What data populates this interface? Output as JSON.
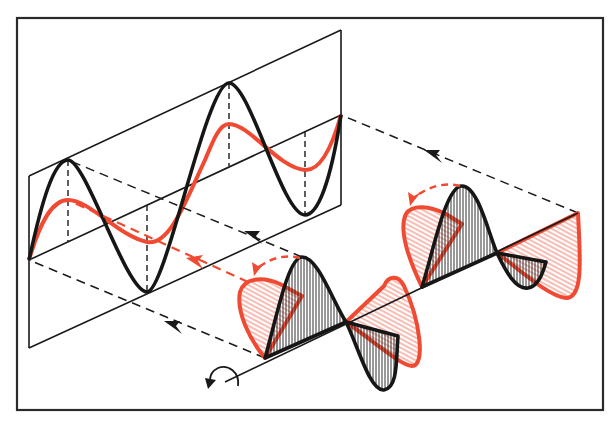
{
  "diagram": {
    "colors": {
      "background": "#ffffff",
      "line": "#1a1a1a",
      "wave_black": "#161616",
      "wave_red": "#f04a32",
      "hatch_red": "#f27a68"
    },
    "elements": {
      "frame": "outer-border",
      "projection_plane": "left-parallelogram-panel",
      "black_wave_2d": "sine wave (large amplitude) on projection plane",
      "red_wave_2d": "sine wave (smaller amplitude) on projection plane",
      "propagation_axis": "3D axis in lower right",
      "black_wave_3d": "hatched black lobes along axis",
      "red_wave_3d": "hatched red lobes perpendicular to black",
      "rotation_arrows": "red dashed curved arrows showing rotation",
      "projection_lines": "black dashed lines with arrowheads pointing back to plane",
      "rotation_symbol": "curved arrow at start of axis"
    },
    "labels": []
  }
}
